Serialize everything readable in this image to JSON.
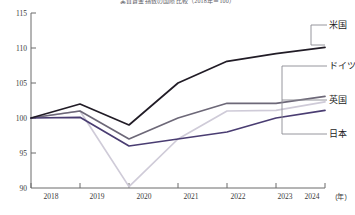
{
  "chart_data": {
    "type": "line",
    "title": "実質賃金指数の国際比較（2018年＝100）",
    "xlabel": "(年)",
    "ylabel": "",
    "categories": [
      2018,
      2019,
      2020,
      2021,
      2022,
      2023,
      2024
    ],
    "x_tick_labels": [
      "2018",
      "2019",
      "2020",
      "2021",
      "2022",
      "2023",
      "2024"
    ],
    "y_tick_labels": [
      "90",
      "95",
      "100",
      "105",
      "110",
      "115"
    ],
    "y_ticks": [
      90,
      95,
      100,
      105,
      110,
      115
    ],
    "ylim": [
      90,
      115
    ],
    "xlim": [
      2018,
      2024
    ],
    "grid": false,
    "legend_position": "right-callout",
    "series": [
      {
        "name": "米国",
        "color": "#211c26",
        "values": [
          100.0,
          102.0,
          99.0,
          105.0,
          108.1,
          109.2,
          110.1
        ]
      },
      {
        "name": "ドイツ",
        "color": "#cfcbd8",
        "values": [
          100.0,
          101.0,
          90.2,
          97.0,
          101.0,
          101.1,
          102.3
        ]
      },
      {
        "name": "英国",
        "color": "#6d6878",
        "values": [
          100.0,
          101.0,
          97.0,
          100.0,
          102.1,
          102.1,
          103.1
        ]
      },
      {
        "name": "日本",
        "color": "#4a3d72",
        "values": [
          100.0,
          100.1,
          96.0,
          97.0,
          98.0,
          100.0,
          101.1
        ]
      }
    ]
  },
  "axis": {
    "unit_label": "(年)"
  },
  "callouts": [
    {
      "label": "米国"
    },
    {
      "label": "ドイツ"
    },
    {
      "label": "英国"
    },
    {
      "label": "日本"
    }
  ]
}
